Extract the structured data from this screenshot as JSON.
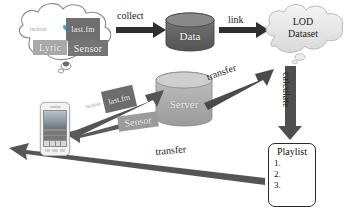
{
  "diagram": {
    "background": "#ffffff"
  },
  "nodes": {
    "source_cloud": {
      "name": "source-cloud",
      "items": [
        {
          "id": "twitter",
          "label": "twitter",
          "icon": "twitter-bird-icon",
          "color": "#9a9a9a"
        },
        {
          "id": "lastfm",
          "label": "last.fm",
          "color": "#6f6f6f"
        },
        {
          "id": "lyric",
          "label": "Lyric",
          "color": "#a9a9a9"
        },
        {
          "id": "sensor",
          "label": "Sensor",
          "color": "#757575"
        }
      ]
    },
    "data_store": {
      "label": "Data",
      "shape": "cylinder",
      "color": "#6a6a6a"
    },
    "server_store": {
      "label": "Server",
      "shape": "cylinder",
      "color": "#b0b0b0"
    },
    "lod_cloud": {
      "label_line1": "LOD",
      "label_line2": "Dataset",
      "shape": "cloud",
      "color": "#ececec"
    },
    "playlist": {
      "title": "Playlist",
      "items": [
        "1.",
        "2.",
        "3."
      ]
    },
    "phone": {
      "label": "smartphone",
      "shape": "device"
    },
    "mobile_sources": [
      {
        "id": "twitter",
        "label": "twitter",
        "color": "#a3a3a3"
      },
      {
        "id": "lastfm",
        "label": "last.fm",
        "color": "#6d6d6d"
      },
      {
        "id": "sensor",
        "label": "Sensor",
        "color": "#9b9b9b"
      }
    ]
  },
  "edges": {
    "collect": {
      "label": "collect",
      "from": "source-cloud",
      "to": "data-store"
    },
    "link": {
      "label": "link",
      "from": "data-store",
      "to": "lod-cloud"
    },
    "transfer_up": {
      "label": "transfer",
      "from": "server-store",
      "to": "lod-cloud"
    },
    "calculate": {
      "label": "calculate",
      "from": "lod-cloud",
      "to": "playlist"
    },
    "transfer_bottom": {
      "label": "transfer",
      "from": "playlist",
      "to": "phone"
    },
    "upload": {
      "label": "",
      "from": "phone",
      "to": "server-store"
    }
  },
  "colors": {
    "arrow_dark": "#3c3c3c",
    "arrow_mid": "#5e5e5e",
    "outline": "#7a7a7a",
    "text": "#1a1a1a"
  }
}
